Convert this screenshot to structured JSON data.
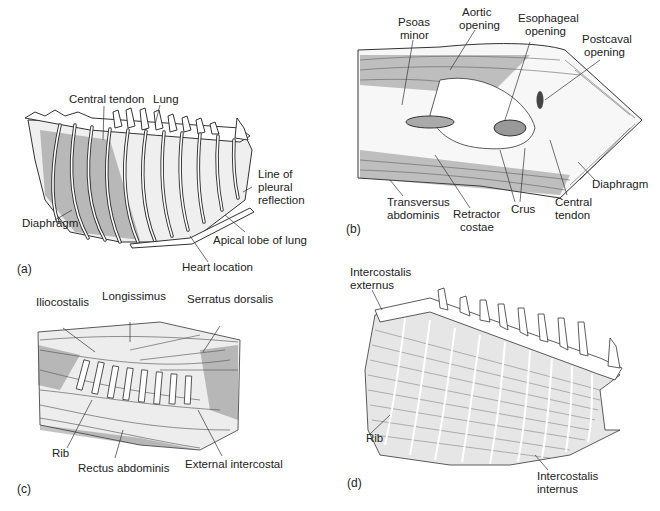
{
  "figure": {
    "panels": [
      {
        "id": "a",
        "panel_label": "(a)",
        "labels": {
          "central_tendon": "Central tendon",
          "lung": "Lung",
          "line_of_pleural_reflection_1": "Line of",
          "line_of_pleural_reflection_2": "pleural",
          "line_of_pleural_reflection_3": "reflection",
          "diaphragm": "Diaphragm",
          "apical_lobe": "Apical lobe of lung",
          "heart_location": "Heart location"
        }
      },
      {
        "id": "b",
        "panel_label": "(b)",
        "labels": {
          "psoas_minor_1": "Psoas",
          "psoas_minor_2": "minor",
          "aortic_opening_1": "Aortic",
          "aortic_opening_2": "opening",
          "esophageal_opening_1": "Esophageal",
          "esophageal_opening_2": "opening",
          "postcaval_opening_1": "Postcaval",
          "postcaval_opening_2": "opening",
          "diaphragm": "Diaphragm",
          "transversus_abdominis_1": "Transversus",
          "transversus_abdominis_2": "abdominis",
          "retractor_costae_1": "Retractor",
          "retractor_costae_2": "costae",
          "crus": "Crus",
          "central_tendon_1": "Central",
          "central_tendon_2": "tendon"
        }
      },
      {
        "id": "c",
        "panel_label": "(c)",
        "labels": {
          "iliocostalis": "Iliocostalis",
          "longissimus": "Longissimus",
          "serratus_dorsalis": "Serratus dorsalis",
          "rib": "Rib",
          "rectus_abdominis": "Rectus abdominis",
          "external_intercostal": "External intercostal"
        }
      },
      {
        "id": "d",
        "panel_label": "(d)",
        "labels": {
          "intercostalis_externus_1": "Intercostalis",
          "intercostalis_externus_2": "externus",
          "rib": "Rib",
          "intercostalis_internus_1": "Intercostalis",
          "intercostalis_internus_2": "internus"
        }
      }
    ]
  }
}
